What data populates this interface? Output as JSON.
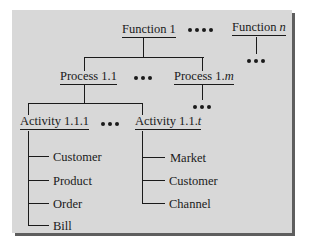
{
  "diagram": {
    "type": "hierarchy-tree",
    "colors": {
      "panel_bg": "#d8d8d8",
      "shadow": "#5e5e5e",
      "ink": "#1a1a1a"
    },
    "functions": [
      {
        "label": "Function 1"
      },
      {
        "label_prefix": "Function ",
        "label_var": "n"
      }
    ],
    "function_separator": "••••",
    "processes": [
      {
        "label": "Process 1.1"
      },
      {
        "label_prefix": "Process 1.",
        "label_var": "m"
      }
    ],
    "process_separator": "•••",
    "activities": [
      {
        "label": "Activity 1.1.1",
        "entities": [
          "Customer",
          "Product",
          "Order",
          "Bill"
        ]
      },
      {
        "label_prefix": "Activity 1.1.",
        "label_var": "t",
        "entities": [
          "Market",
          "Customer",
          "Channel"
        ]
      }
    ],
    "activity_separator": "•••",
    "continuation_marker": "•••"
  }
}
